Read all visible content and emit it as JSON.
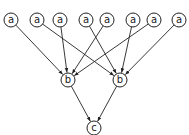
{
  "diagram": {
    "type": "directed-graph",
    "node_radius": 7,
    "stroke_color": "#222222",
    "nodes": [
      {
        "id": "a1",
        "label": "a",
        "x": 11,
        "y": 20
      },
      {
        "id": "a2",
        "label": "a",
        "x": 37,
        "y": 20
      },
      {
        "id": "a3",
        "label": "a",
        "x": 60,
        "y": 20
      },
      {
        "id": "a4",
        "label": "a",
        "x": 86,
        "y": 20
      },
      {
        "id": "a5",
        "label": "a",
        "x": 107,
        "y": 20
      },
      {
        "id": "a6",
        "label": "a",
        "x": 133,
        "y": 20
      },
      {
        "id": "a7",
        "label": "a",
        "x": 154,
        "y": 20
      },
      {
        "id": "a8",
        "label": "a",
        "x": 179,
        "y": 20
      },
      {
        "id": "b1",
        "label": "b",
        "x": 68,
        "y": 80
      },
      {
        "id": "b2",
        "label": "b",
        "x": 120,
        "y": 80
      },
      {
        "id": "c1",
        "label": "c",
        "x": 94,
        "y": 128
      }
    ],
    "edges": [
      {
        "from": "a1",
        "to": "b1"
      },
      {
        "from": "a2",
        "to": "b2"
      },
      {
        "from": "a3",
        "to": "b1"
      },
      {
        "from": "a4",
        "to": "b2"
      },
      {
        "from": "a5",
        "to": "b1"
      },
      {
        "from": "a6",
        "to": "b2"
      },
      {
        "from": "a7",
        "to": "b1"
      },
      {
        "from": "a8",
        "to": "b2"
      },
      {
        "from": "b1",
        "to": "c1"
      },
      {
        "from": "b2",
        "to": "c1"
      }
    ]
  }
}
